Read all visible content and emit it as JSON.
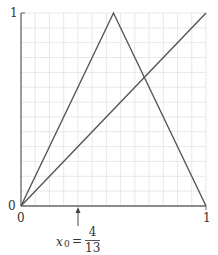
{
  "chart_data": {
    "type": "line",
    "title": "",
    "xlabel": "",
    "ylabel": "",
    "xlim": [
      0,
      1
    ],
    "ylim": [
      0,
      1
    ],
    "grid": true,
    "grid_divisions": 13,
    "x_ticks": [
      "0",
      "1"
    ],
    "y_ticks": [
      "0",
      "1"
    ],
    "series": [
      {
        "name": "tent map",
        "x": [
          0,
          0.5,
          1
        ],
        "y": [
          0,
          1,
          0
        ],
        "color": "#555555"
      },
      {
        "name": "identity y=x",
        "x": [
          0,
          1
        ],
        "y": [
          0,
          1
        ],
        "color": "#555555"
      }
    ],
    "annotations": [
      {
        "type": "arrow",
        "x": 0.3077,
        "label": "x0 = 4/13"
      }
    ]
  },
  "labels": {
    "y_top": "1",
    "y_bottom": "0",
    "x_left": "0",
    "x_right": "1",
    "x0_var": "x",
    "x0_sub": "0",
    "x0_eq": "=",
    "x0_num": "4",
    "x0_den": "13"
  },
  "colors": {
    "line": "#555555",
    "grid": "#e2e2e2",
    "axis": "#666666"
  }
}
